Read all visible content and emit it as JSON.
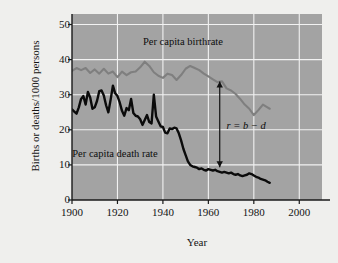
{
  "figure": {
    "background_color": "#efefed",
    "plot_background_color": "#a3a3a3",
    "grid_color": "#f2f2f2",
    "axis_color": "#1a1a1a"
  },
  "labels": {
    "ylabel": "Births or deaths/1000 persons",
    "xlabel": "Year",
    "birthrate_label": "Per capita birthrate",
    "deathrate_label": "Per capita death rate",
    "arrow_annotation": "r = b − d"
  },
  "chart_data": {
    "type": "line",
    "title": "",
    "xlabel": "Year",
    "ylabel": "Births or deaths/1000 persons",
    "xlim": [
      1900,
      2010
    ],
    "ylim": [
      0,
      53
    ],
    "xticks": [
      1900,
      1920,
      1940,
      1960,
      1980,
      2000
    ],
    "yticks": [
      0,
      10,
      20,
      30,
      40,
      50
    ],
    "grid": true,
    "legend": "inline-annotations",
    "annotations": [
      {
        "text": "Per capita birthrate",
        "x": 1955,
        "y": 45,
        "color": "#0d0d0d"
      },
      {
        "text": "Per capita death rate",
        "x": 1923,
        "y": 13,
        "color": "#0d0d0d"
      },
      {
        "text": "r = b − d",
        "x": 1968,
        "y": 21,
        "color": "#0d0d0d",
        "italic": true
      }
    ],
    "arrow": {
      "type": "double-headed-vertical",
      "x": 1965,
      "y_bottom": 9.3,
      "y_top": 33.8,
      "color": "#111111"
    },
    "series": [
      {
        "name": "Per capita birthrate",
        "color": "#7f7f7f",
        "linewidth": 2.1,
        "x": [
          1900,
          1902,
          1904,
          1906,
          1908,
          1910,
          1912,
          1914,
          1916,
          1918,
          1920,
          1922,
          1924,
          1926,
          1928,
          1930,
          1932,
          1934,
          1936,
          1938,
          1940,
          1942,
          1944,
          1946,
          1948,
          1950,
          1952,
          1954,
          1956,
          1958,
          1960,
          1962,
          1964,
          1966,
          1968,
          1970,
          1972,
          1974,
          1976,
          1978,
          1980,
          1982,
          1984,
          1986,
          1987
        ],
        "y": [
          36.8,
          37.6,
          37.0,
          37.6,
          36.2,
          37.2,
          36.0,
          37.4,
          36.0,
          36.6,
          35.0,
          36.6,
          35.6,
          36.4,
          36.6,
          37.8,
          39.4,
          38.2,
          36.4,
          35.4,
          34.8,
          36.0,
          35.6,
          34.2,
          35.6,
          37.4,
          38.2,
          37.6,
          37.0,
          36.0,
          35.2,
          34.4,
          33.6,
          33.8,
          31.8,
          31.2,
          30.2,
          28.8,
          27.2,
          26.0,
          24.2,
          25.6,
          27.2,
          26.4,
          26.0
        ]
      },
      {
        "name": "Per capita death rate",
        "color": "#0b0b0b",
        "linewidth": 2.4,
        "x": [
          1900,
          1901,
          1902,
          1903,
          1904,
          1905,
          1906,
          1907,
          1908,
          1909,
          1910,
          1911,
          1912,
          1913,
          1914,
          1915,
          1916,
          1917,
          1918,
          1919,
          1920,
          1921,
          1922,
          1923,
          1924,
          1925,
          1926,
          1927,
          1928,
          1929,
          1930,
          1931,
          1932,
          1933,
          1934,
          1935,
          1936,
          1937,
          1938,
          1939,
          1940,
          1941,
          1942,
          1943,
          1944,
          1945,
          1946,
          1947,
          1948,
          1949,
          1950,
          1951,
          1952,
          1953,
          1954,
          1955,
          1956,
          1957,
          1958,
          1959,
          1960,
          1961,
          1962,
          1963,
          1964,
          1965,
          1966,
          1967,
          1968,
          1969,
          1970,
          1971,
          1972,
          1973,
          1974,
          1975,
          1976,
          1977,
          1978,
          1979,
          1980,
          1981,
          1982,
          1983,
          1984,
          1985,
          1986,
          1987
        ],
        "y": [
          25.8,
          25.2,
          24.6,
          26.4,
          28.8,
          29.6,
          27.2,
          30.8,
          29.2,
          26.0,
          26.4,
          28.2,
          31.0,
          31.2,
          29.8,
          27.0,
          25.0,
          28.6,
          32.6,
          30.4,
          29.6,
          27.8,
          25.4,
          24.0,
          26.2,
          25.6,
          28.8,
          24.8,
          24.0,
          23.8,
          23.0,
          21.4,
          22.8,
          24.2,
          22.2,
          21.8,
          30.0,
          23.8,
          22.4,
          21.0,
          20.8,
          19.2,
          19.0,
          20.4,
          20.2,
          20.6,
          20.4,
          19.0,
          17.0,
          14.6,
          12.8,
          11.0,
          10.0,
          9.6,
          9.4,
          9.2,
          8.8,
          9.0,
          8.6,
          8.4,
          8.8,
          8.6,
          8.4,
          8.6,
          8.2,
          8.0,
          7.8,
          8.0,
          7.8,
          7.6,
          7.8,
          7.4,
          7.2,
          7.4,
          7.0,
          6.8,
          7.0,
          7.2,
          7.6,
          7.4,
          7.0,
          6.6,
          6.4,
          6.0,
          5.8,
          5.6,
          5.2,
          4.9
        ]
      }
    ]
  }
}
